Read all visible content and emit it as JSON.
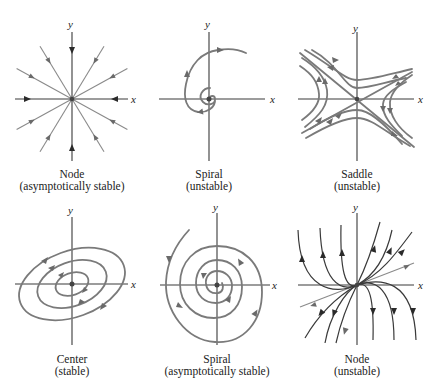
{
  "figure": {
    "axis_labels": {
      "x": "x",
      "y": "y"
    },
    "panels": [
      {
        "id": "node-stable",
        "title": "Node",
        "subtitle": "(asymptotically stable)"
      },
      {
        "id": "spiral-unstable",
        "title": "Spiral",
        "subtitle": "(unstable)"
      },
      {
        "id": "saddle-unstable",
        "title": "Saddle",
        "subtitle": "(unstable)"
      },
      {
        "id": "center-stable",
        "title": "Center",
        "subtitle": "(stable)"
      },
      {
        "id": "spiral-stable",
        "title": "Spiral",
        "subtitle": "(asymptotically stable)"
      },
      {
        "id": "node-unstable",
        "title": "Node",
        "subtitle": "(unstable)"
      }
    ]
  },
  "colors": {
    "axis": "#3a3a3a",
    "trajectory": "#7a7a7a",
    "trajectory_dark": "#3a3a3a",
    "text": "#222222"
  }
}
